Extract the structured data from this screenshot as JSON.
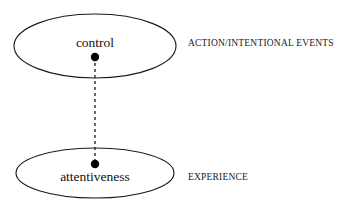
{
  "diagram": {
    "background_color": "#ffffff",
    "stroke_color": "#1a1a1a",
    "dot_color": "#000000",
    "nodes": [
      {
        "id": "control",
        "label": "control",
        "shape": "ellipse",
        "cx": 95,
        "cy": 46,
        "rx": 81,
        "ry": 32,
        "dot": {
          "cx": 95,
          "cy": 57,
          "r": 4.2
        }
      },
      {
        "id": "attentiveness",
        "label": "attentiveness",
        "shape": "ellipse",
        "cx": 95,
        "cy": 173,
        "rx": 79,
        "ry": 25,
        "dot": {
          "cx": 95,
          "cy": 164,
          "r": 4.2
        }
      }
    ],
    "connector": {
      "id": "control-attentiveness-link",
      "style": "dashed",
      "x": 95,
      "y1": 57,
      "y2": 164,
      "dash_pattern": "3 3"
    },
    "side_labels": [
      {
        "id": "action-intentional-events",
        "text": "ACTION/INTENTIONAL EVENTS"
      },
      {
        "id": "experience",
        "text": "EXPERIENCE"
      }
    ]
  }
}
